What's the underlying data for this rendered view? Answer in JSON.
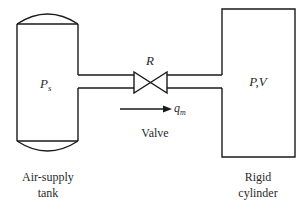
{
  "diagram": {
    "components": {
      "supply_tank": {
        "symbol": "P",
        "symbol_subscript": "s",
        "caption_line1": "Air-supply",
        "caption_line2": "tank"
      },
      "valve": {
        "symbol": "R",
        "caption": "Valve"
      },
      "flow": {
        "symbol": "q",
        "symbol_subscript": "m",
        "direction": "left-to-right"
      },
      "cylinder": {
        "symbol": "P,V",
        "caption_line1": "Rigid",
        "caption_line2": "cylinder"
      }
    },
    "connections": [
      {
        "from": "supply_tank",
        "to": "valve"
      },
      {
        "from": "valve",
        "to": "cylinder"
      }
    ]
  }
}
